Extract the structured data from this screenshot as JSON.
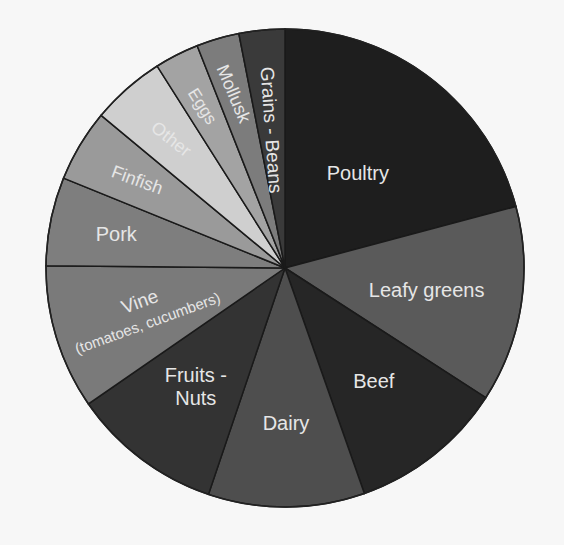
{
  "chart_data": {
    "type": "pie",
    "title": "",
    "start_angle_deg": 0,
    "direction": "clockwise",
    "legend": "none (labels inside slices)",
    "categories": [
      "Poultry",
      "Leafy greens",
      "Beef",
      "Dairy",
      "Fruits - Nuts",
      "Vine (tomatoes, cucumbers)",
      "Pork",
      "Finfish",
      "Other",
      "Eggs",
      "Mollusk",
      "Grains - Beans"
    ],
    "values": [
      20.9,
      13.3,
      10.5,
      10.6,
      10.2,
      9.8,
      6.0,
      4.9,
      5.0,
      3.0,
      2.9,
      3.1
    ],
    "unit": "% (estimated share of pie)",
    "slices": [
      {
        "label": "Poultry",
        "lines": [
          "Poultry"
        ],
        "value": 20.9,
        "color": "#1e1e1e",
        "text_color": "#e6e6e6"
      },
      {
        "label": "Leafy greens",
        "lines": [
          "Leafy greens"
        ],
        "value": 13.3,
        "color": "#5a5a5a",
        "text_color": "#e6e6e6"
      },
      {
        "label": "Beef",
        "lines": [
          "Beef"
        ],
        "value": 10.5,
        "color": "#262626",
        "text_color": "#e6e6e6"
      },
      {
        "label": "Dairy",
        "lines": [
          "Dairy"
        ],
        "value": 10.6,
        "color": "#4e4e4e",
        "text_color": "#e6e6e6"
      },
      {
        "label": "Fruits - Nuts",
        "lines": [
          "Fruits -",
          "Nuts"
        ],
        "value": 10.2,
        "color": "#333333",
        "text_color": "#e6e6e6"
      },
      {
        "label": "Vine (tomatoes, cucumbers)",
        "lines": [
          "Vine",
          "(tomatoes, cucumbers)"
        ],
        "value": 9.8,
        "color": "#7a7a7a",
        "text_color": "#e6e6e6"
      },
      {
        "label": "Pork",
        "lines": [
          "Pork"
        ],
        "value": 6.0,
        "color": "#7e7e7e",
        "text_color": "#e6e6e6"
      },
      {
        "label": "Finfish",
        "lines": [
          "Finfish"
        ],
        "value": 4.9,
        "color": "#9a9a9a",
        "text_color": "#eeeeee"
      },
      {
        "label": "Other",
        "lines": [
          "Other"
        ],
        "value": 5.0,
        "color": "#cfcfcf",
        "text_color": "#222222"
      },
      {
        "label": "Eggs",
        "lines": [
          "Eggs"
        ],
        "value": 3.0,
        "color": "#a3a3a3",
        "text_color": "#eeeeee"
      },
      {
        "label": "Mollusk",
        "lines": [
          "Mollusk"
        ],
        "value": 2.9,
        "color": "#7c7c7c",
        "text_color": "#e6e6e6"
      },
      {
        "label": "Grains - Beans",
        "lines": [
          "Grains - Beans"
        ],
        "value": 3.1,
        "color": "#3a3a3a",
        "text_color": "#e6e6e6"
      }
    ]
  }
}
